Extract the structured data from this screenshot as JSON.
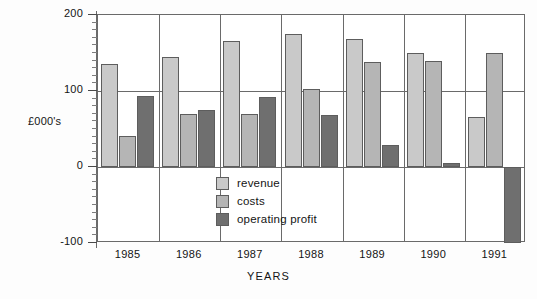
{
  "chart_data": {
    "type": "bar",
    "title": "",
    "xlabel": "YEARS",
    "ylabel": "£000's",
    "categories": [
      "1985",
      "1986",
      "1987",
      "1988",
      "1989",
      "1990",
      "1991"
    ],
    "ylim": [
      -100,
      200
    ],
    "yticks": [
      -100,
      0,
      100,
      200
    ],
    "ytick_labels": [
      "-100",
      "0",
      "100",
      "200"
    ],
    "minor_tick_step": 10,
    "grid": true,
    "grid_lines_at": [
      0,
      100
    ],
    "legend_position": "inside-bottom-center",
    "series": [
      {
        "name": "revenue",
        "color": "#c9c9c9",
        "values": [
          135,
          145,
          166,
          175,
          168,
          150,
          66
        ]
      },
      {
        "name": "costs",
        "color": "#b5b5b5",
        "values": [
          41,
          70,
          70,
          103,
          138,
          140,
          150
        ]
      },
      {
        "name": "operating profit",
        "color": "#6f6f6f",
        "values": [
          93,
          75,
          92,
          69,
          29,
          5,
          -100
        ]
      }
    ]
  },
  "axes": {
    "y_title": "£000's",
    "x_title": "YEARS"
  },
  "legend": {
    "items": [
      {
        "label": "revenue",
        "color": "#c9c9c9"
      },
      {
        "label": "costs",
        "color": "#b5b5b5"
      },
      {
        "label": "operating profit",
        "color": "#6f6f6f"
      }
    ]
  }
}
